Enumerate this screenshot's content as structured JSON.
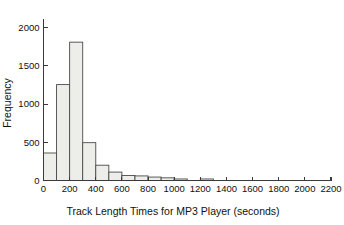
{
  "chart_data": {
    "type": "bar",
    "title": "",
    "subtitle": "",
    "xlabel": "Track Length Times for MP3 Player (seconds)",
    "ylabel": "Frequency",
    "xlim": [
      0,
      2200
    ],
    "ylim": [
      0,
      2100
    ],
    "grid": false,
    "legend": null,
    "bin_width": 100,
    "bar_fill_color": "#ededea",
    "bar_edge_color": "#4a4a4a",
    "axis_color": "#3a3a3a",
    "background_color": "#ffffff",
    "xticks": [
      0,
      200,
      400,
      600,
      800,
      1000,
      1200,
      1400,
      1600,
      1800,
      2000,
      2200
    ],
    "xtick_labels": [
      "0",
      "200",
      "400",
      "600",
      "800",
      "1000",
      "1200",
      "1400",
      "1600",
      "1800",
      "2000",
      "2200"
    ],
    "yticks": [
      0,
      500,
      1000,
      1500,
      2000
    ],
    "ytick_labels": [
      "0",
      "500",
      "1000",
      "1500",
      "2000"
    ],
    "bins": [
      {
        "start": 0,
        "end": 100,
        "value": 360
      },
      {
        "start": 100,
        "end": 200,
        "value": 1255
      },
      {
        "start": 200,
        "end": 300,
        "value": 1810
      },
      {
        "start": 300,
        "end": 400,
        "value": 495
      },
      {
        "start": 400,
        "end": 500,
        "value": 200
      },
      {
        "start": 500,
        "end": 600,
        "value": 110
      },
      {
        "start": 600,
        "end": 700,
        "value": 65
      },
      {
        "start": 700,
        "end": 800,
        "value": 60
      },
      {
        "start": 800,
        "end": 900,
        "value": 45
      },
      {
        "start": 900,
        "end": 1000,
        "value": 35
      },
      {
        "start": 1000,
        "end": 1100,
        "value": 20
      },
      {
        "start": 1100,
        "end": 1200,
        "value": 0
      },
      {
        "start": 1200,
        "end": 1300,
        "value": 20
      },
      {
        "start": 1300,
        "end": 1400,
        "value": 0
      },
      {
        "start": 1400,
        "end": 1500,
        "value": 0
      },
      {
        "start": 1500,
        "end": 1600,
        "value": 0
      },
      {
        "start": 1600,
        "end": 1700,
        "value": 0
      },
      {
        "start": 1700,
        "end": 1800,
        "value": 0
      },
      {
        "start": 1800,
        "end": 1900,
        "value": 0
      },
      {
        "start": 1900,
        "end": 2000,
        "value": 0
      },
      {
        "start": 2000,
        "end": 2100,
        "value": 0
      },
      {
        "start": 2100,
        "end": 2200,
        "value": 0
      }
    ]
  }
}
